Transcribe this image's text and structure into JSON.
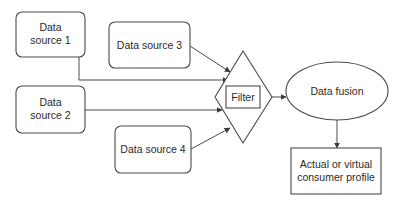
{
  "diagram": {
    "type": "flowchart",
    "nodes": {
      "ds1": {
        "line1": "Data",
        "line2": "source 1",
        "shape": "rounded-rectangle"
      },
      "ds2": {
        "line1": "Data",
        "line2": "source 2",
        "shape": "rounded-rectangle"
      },
      "ds3": {
        "label": "Data source 3",
        "shape": "rounded-rectangle"
      },
      "ds4": {
        "label": "Data source 4",
        "shape": "rounded-rectangle"
      },
      "filter": {
        "label": "Filter",
        "shape": "diamond-with-inner-rectangle"
      },
      "fusion": {
        "label": "Data fusion",
        "shape": "ellipse"
      },
      "profile": {
        "line1": "Actual or virtual",
        "line2": "consumer profile",
        "shape": "rectangle"
      }
    },
    "edges": [
      {
        "from": "Data source 1",
        "to": "Filter"
      },
      {
        "from": "Data source 2",
        "to": "Filter"
      },
      {
        "from": "Data source 3",
        "to": "Filter"
      },
      {
        "from": "Data source 4",
        "to": "Filter"
      },
      {
        "from": "Filter",
        "to": "Data fusion"
      },
      {
        "from": "Data fusion",
        "to": "Actual or virtual consumer profile"
      }
    ],
    "colors": {
      "stroke": "#4a4a4a",
      "text": "#2a2a2a",
      "background": "#ffffff"
    }
  }
}
